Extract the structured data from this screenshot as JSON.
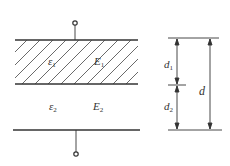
{
  "diagram": {
    "layer1": {
      "permittivity": "ε",
      "perm_sub": "1",
      "field": "E",
      "field_sub": "1",
      "hatched": true
    },
    "layer2": {
      "permittivity": "ε",
      "perm_sub": "2",
      "field": "E",
      "field_sub": "2",
      "hatched": false
    },
    "dimensions": {
      "d1": {
        "symbol": "d",
        "sub": "1"
      },
      "d2": {
        "symbol": "d",
        "sub": "2"
      },
      "d": {
        "symbol": "d"
      }
    },
    "colors": {
      "line": "#333333",
      "hatch": "#444444",
      "background": "#ffffff"
    }
  }
}
